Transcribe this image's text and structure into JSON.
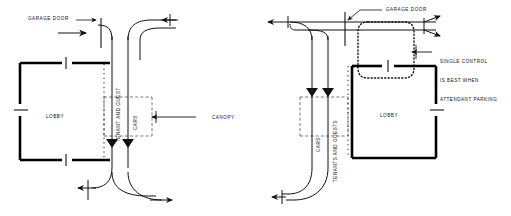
{
  "figure": {
    "type": "architectural-flow-diagram",
    "stroke_color": "#111111",
    "wall_color": "#000000",
    "background": "#ffffff"
  },
  "left_scheme": {
    "name": "separate-control",
    "labels": {
      "garage_door": "GARAGE DOOR",
      "lobby": "LOBBY",
      "tenant_and_guest": "TENANT AND GUEST",
      "cars": "CARS",
      "canopy": "CANOPY"
    }
  },
  "right_scheme": {
    "name": "single-control",
    "labels": {
      "garage_door": "GARAGE DOOR",
      "lobby": "LOBBY",
      "cars": "CARS",
      "tenants_and_guests": "TENANTS AND GUESTS",
      "note_line_1": "SINGLE CONTROL",
      "note_line_2": "IS BEST WHEN",
      "note_line_3": "ATTENDANT PARKING"
    }
  }
}
